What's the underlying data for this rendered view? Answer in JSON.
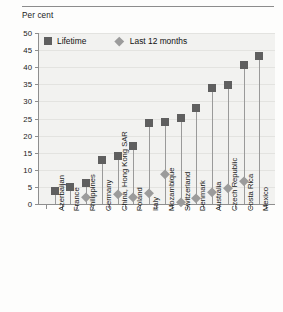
{
  "chart_data": {
    "type": "scatter",
    "title": "",
    "ylabel": "Per cent",
    "xlabel": "",
    "ylim": [
      0,
      50
    ],
    "yticks": [
      0,
      5,
      10,
      15,
      20,
      25,
      30,
      35,
      40,
      45,
      50
    ],
    "grid": true,
    "legend_position": "top-left",
    "categories": [
      "Azerbaijan",
      "France",
      "Philippines",
      "Germany",
      "China, Hong Kong SAR",
      "Poland",
      "Italy",
      "Mozambique",
      "Switzerland",
      "Denmark",
      "Australia",
      "Czech Republic",
      "Costa Rica",
      "Mexico"
    ],
    "series": [
      {
        "name": "Lifetime",
        "marker": "square",
        "color": "#5f5f5f",
        "values": [
          3.7,
          5.0,
          6.0,
          13.0,
          14.0,
          17.0,
          23.7,
          24.1,
          25.1,
          28.0,
          33.8,
          34.8,
          40.6,
          43.4
        ]
      },
      {
        "name": "Last 12 months",
        "marker": "diamond",
        "color": "#9b9b9b",
        "values": [
          null,
          null,
          2.0,
          null,
          3.0,
          2.0,
          3.3,
          8.9,
          0.7,
          1.9,
          3.6,
          4.6,
          6.8,
          null
        ]
      }
    ]
  },
  "legend": {
    "items": [
      {
        "label": "Lifetime",
        "marker": "square-marker-icon"
      },
      {
        "label": "Last 12 months",
        "marker": "diamond-marker-icon"
      }
    ]
  },
  "colors": {
    "lifetime": "#5f5f5f",
    "last12": "#9b9b9b",
    "plot_bg": "#f2f2f0",
    "axis": "#8e8e8e",
    "grid": "#e3e3e0",
    "text": "#1a1a1a"
  }
}
